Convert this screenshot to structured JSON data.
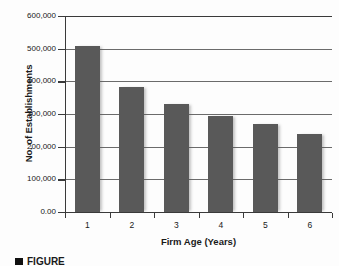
{
  "chart_data": {
    "type": "bar",
    "title": "",
    "categories": [
      "1",
      "2",
      "3",
      "4",
      "5",
      "6"
    ],
    "values": [
      508000,
      383000,
      330000,
      295000,
      268000,
      238000
    ],
    "xlabel": "Firm Age (Years)",
    "ylabel": "No. of Establishments",
    "ylim": [
      0,
      600000
    ],
    "ytick_values": [
      600000,
      500000,
      400000,
      300000,
      200000,
      100000,
      0
    ],
    "ytick_labels": [
      "600,000",
      "500,000",
      "400,000",
      "300,000",
      "200,000",
      "100,000",
      "0.00"
    ],
    "grid": true,
    "legend": null,
    "bar_color": "#595959",
    "axis_color": "#3a3a3a",
    "grid_color": "#6b6b6b"
  },
  "caption": {
    "marker": "black-square",
    "text": "FIGURE"
  }
}
